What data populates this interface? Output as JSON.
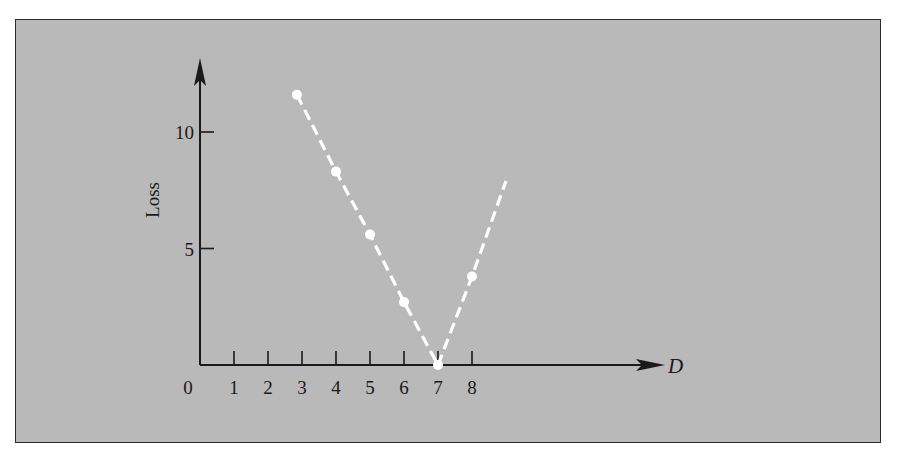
{
  "chart_data": {
    "type": "line",
    "title": "",
    "xlabel": "D",
    "ylabel": "Loss",
    "xlim": [
      0,
      9
    ],
    "ylim": [
      0,
      12.5
    ],
    "x_ticks": [
      0,
      1,
      2,
      3,
      4,
      5,
      6,
      7,
      8
    ],
    "x_tick_labels": [
      "0",
      "1",
      "2",
      "3",
      "4",
      "5",
      "6",
      "7",
      "8"
    ],
    "y_ticks": [
      5,
      10
    ],
    "y_tick_labels": [
      "5",
      "10"
    ],
    "grid": false,
    "legend": null,
    "series": [
      {
        "name": "Loss",
        "style": "dashed-white-with-markers",
        "points": [
          {
            "x": 2.85,
            "y": 11.6
          },
          {
            "x": 4,
            "y": 8.3
          },
          {
            "x": 5,
            "y": 5.6
          },
          {
            "x": 6,
            "y": 2.7
          },
          {
            "x": 7,
            "y": 0
          },
          {
            "x": 8,
            "y": 3.8
          }
        ],
        "line_end": {
          "x": 9,
          "y": 7.9
        }
      }
    ],
    "colors": {
      "background": "#b9b9b9",
      "axis": "#1a1a1a",
      "series": "#ffffff",
      "frame": "#2a2a2a"
    }
  }
}
